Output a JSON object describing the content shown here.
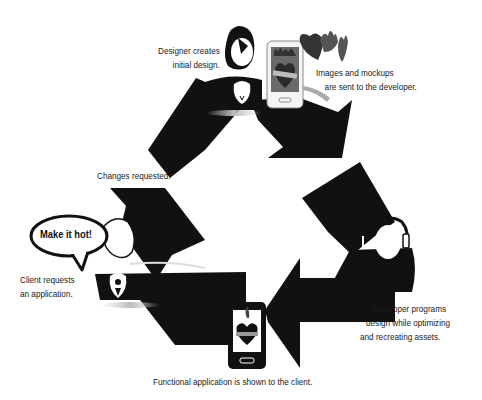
{
  "diagram": {
    "type": "cycle",
    "style": "recycle-symbol with three arrows",
    "colors": {
      "arrow": "#111111",
      "background": "#ffffff",
      "figure_face": "#ffffff",
      "accent_heart": "#444444"
    },
    "steps": [
      {
        "id": "designer",
        "label_line1": "Designer creates",
        "label_line2": "initial design.",
        "icon": "designer-figure-icon"
      },
      {
        "id": "images",
        "label_line1": "Images and mockups",
        "label_line2": "are sent to the developer.",
        "icon": "phone-mockup-icon"
      },
      {
        "id": "developer",
        "label_line1": "Developer programs",
        "label_line2": "design while optimizing",
        "label_line3": "and recreating assets.",
        "icon": "developer-headphones-icon"
      },
      {
        "id": "functional",
        "label_line1": "Functional application is shown to the client.",
        "icon": "phone-app-icon"
      },
      {
        "id": "client",
        "label_line1": "Client requests",
        "label_line2": "an application.",
        "icon": "client-figure-icon"
      },
      {
        "id": "changes",
        "label_line1": "Changes requested.",
        "icon": "arrow-icon"
      }
    ],
    "speech_bubble": "Make it hot!"
  }
}
